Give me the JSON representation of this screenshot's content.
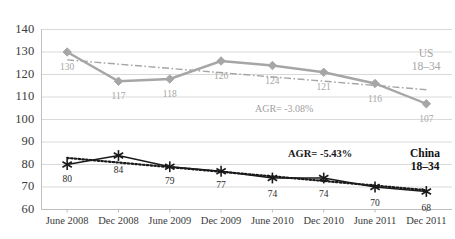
{
  "chart_data": {
    "type": "line",
    "title": "",
    "xlabel": "",
    "ylabel": "",
    "categories": [
      "June 2008",
      "Dec 2008",
      "June 2009",
      "Dec 2009",
      "June 2010",
      "Dec 2010",
      "June 2011",
      "Dec 2011"
    ],
    "ylim": [
      60,
      140
    ],
    "yticks": [
      "60",
      "70",
      "80",
      "90",
      "100",
      "110",
      "120",
      "130",
      "140"
    ],
    "grid": true,
    "legend_position": "right-inline",
    "series": [
      {
        "name": "US 18–34",
        "values": [
          130,
          117,
          118,
          126,
          124,
          121,
          116,
          107
        ],
        "color": "#a6a6a6",
        "marker": "diamond",
        "trendline": "dash-dot",
        "annotation": "AGR= -3.08%"
      },
      {
        "name": "China 18–34",
        "values": [
          80,
          84,
          79,
          77,
          74,
          74,
          70,
          68
        ],
        "color": "#1a1a1a",
        "marker": "asterisk",
        "trendline": "dotted",
        "annotation": "AGR= -5.43%"
      }
    ],
    "annotations": [
      {
        "text": "AGR= -3.08%",
        "series": "US 18–34"
      },
      {
        "text": "AGR= -5.43%",
        "series": "China 18–34"
      }
    ]
  },
  "legend": {
    "us": {
      "line1": "US",
      "line2": "18–34"
    },
    "china": {
      "line1": "China",
      "line2": "18–34"
    }
  },
  "colors": {
    "us_series": "#a6a6a6",
    "china_series": "#1a1a1a",
    "gridline": "#d9d9d9",
    "axis": "#bfbfbf",
    "background": "#ffffff"
  }
}
